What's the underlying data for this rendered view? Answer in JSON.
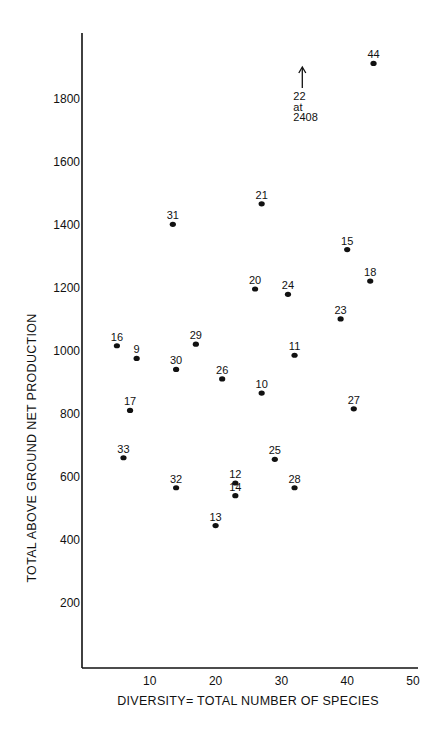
{
  "chart_data": {
    "type": "scatter",
    "title": "",
    "xlabel": "DIVERSITY= TOTAL NUMBER OF SPECIES",
    "ylabel": "TOTAL ABOVE GROUND NET PRODUCTION",
    "xlim": [
      0,
      50
    ],
    "ylim": [
      0,
      2000
    ],
    "grid": false,
    "x_ticks": [
      10,
      20,
      30,
      40,
      50
    ],
    "y_ticks": [
      200,
      400,
      600,
      800,
      1000,
      1200,
      1400,
      1600,
      1800
    ],
    "points": [
      {
        "label": "44",
        "x": 44,
        "y": 1910
      },
      {
        "label": "31",
        "x": 13.5,
        "y": 1400
      },
      {
        "label": "21",
        "x": 27,
        "y": 1465
      },
      {
        "label": "15",
        "x": 40,
        "y": 1320
      },
      {
        "label": "18",
        "x": 43.5,
        "y": 1220
      },
      {
        "label": "20",
        "x": 26,
        "y": 1195
      },
      {
        "label": "24",
        "x": 31,
        "y": 1178
      },
      {
        "label": "23",
        "x": 39,
        "y": 1100
      },
      {
        "label": "16",
        "x": 5,
        "y": 1015
      },
      {
        "label": "29",
        "x": 17,
        "y": 1020
      },
      {
        "label": "9",
        "x": 8,
        "y": 975
      },
      {
        "label": "11",
        "x": 32,
        "y": 985
      },
      {
        "label": "30",
        "x": 14,
        "y": 940
      },
      {
        "label": "26",
        "x": 21,
        "y": 910
      },
      {
        "label": "10",
        "x": 27,
        "y": 865
      },
      {
        "label": "17",
        "x": 7,
        "y": 810
      },
      {
        "label": "27",
        "x": 41,
        "y": 815
      },
      {
        "label": "33",
        "x": 6,
        "y": 660
      },
      {
        "label": "25",
        "x": 29,
        "y": 655
      },
      {
        "label": "12",
        "x": 23,
        "y": 580
      },
      {
        "label": "32",
        "x": 14,
        "y": 565
      },
      {
        "label": "28",
        "x": 32,
        "y": 565
      },
      {
        "label": "14",
        "x": 23,
        "y": 540
      },
      {
        "label": "13",
        "x": 20,
        "y": 445
      }
    ],
    "annotations": [
      {
        "text_lines": [
          "22",
          "at",
          "2408"
        ],
        "x": 35,
        "arrow": "up",
        "note": "point 22 off-scale at 2408"
      }
    ]
  }
}
